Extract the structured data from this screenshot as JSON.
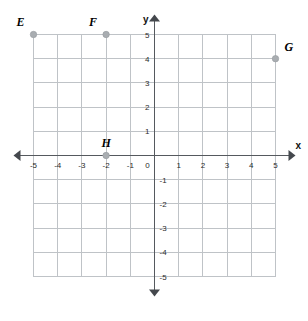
{
  "chart_data": {
    "type": "scatter",
    "title": "",
    "xlabel": "x",
    "ylabel": "y",
    "xlim": [
      -5,
      5
    ],
    "ylim": [
      -5,
      5
    ],
    "grid": true,
    "legend": "none",
    "x_tick_labels": [
      "-5",
      "-4",
      "-3",
      "-2",
      "-1",
      "0",
      "1",
      "2",
      "3",
      "4",
      "5"
    ],
    "x_tick_values": [
      -5,
      -4,
      -3,
      -2,
      -1,
      0,
      1,
      2,
      3,
      4,
      5
    ],
    "y_tick_labels": [
      "5",
      "4",
      "3",
      "2",
      "1",
      "-1",
      "-2",
      "-3",
      "-4",
      "-5"
    ],
    "y_tick_values": [
      5,
      4,
      3,
      2,
      1,
      -1,
      -2,
      -3,
      -4,
      -5
    ],
    "origin_label": "0",
    "points": [
      {
        "label": "E",
        "x": -5,
        "y": 5,
        "label_position": "above-left"
      },
      {
        "label": "F",
        "x": -2,
        "y": 5,
        "label_position": "above-left"
      },
      {
        "label": "G",
        "x": 5,
        "y": 4,
        "label_position": "above-right"
      },
      {
        "label": "H",
        "x": -2,
        "y": 0,
        "label_position": "above"
      }
    ],
    "colors": {
      "background": "#ffffff",
      "gridline": "#bfc3c7",
      "axis": "#55595e",
      "point_fill": "#a9adb1",
      "label_text": "#000000",
      "tick_text": "#2b2b2b"
    }
  },
  "axes": {
    "x_name": "x",
    "y_name": "y"
  }
}
